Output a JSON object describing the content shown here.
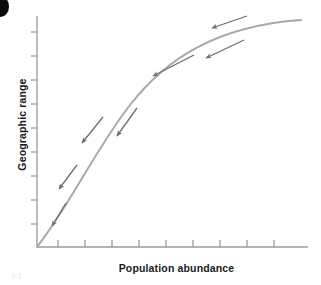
{
  "figure": {
    "caption": "(c)",
    "corner_mark": "page-edge-blob",
    "axes": {
      "x": {
        "label": "Population abundance",
        "tick_count": 9,
        "tick_positions": [
          58,
          85,
          112,
          139,
          166,
          193,
          220,
          247,
          274
        ],
        "axis_color": "#9a9a9a",
        "origin_x": 37,
        "end_x": 308,
        "y": 247
      },
      "y": {
        "label": "Geographic range",
        "tick_count": 9,
        "tick_positions": [
          32,
          56,
          80,
          104,
          128,
          152,
          176,
          200,
          224
        ],
        "axis_color": "#9a9a9a",
        "origin_y": 247,
        "end_y": 16,
        "x": 37
      }
    },
    "curve": {
      "name": "saturating-growth-curve",
      "color": "#a8a8a8",
      "stroke_width": 2.0,
      "path": "M 37,247 C 70,205 95,150 130,105 C 165,60 215,26 301,20"
    },
    "arrows": {
      "color": "#6e6e6e",
      "direction_note": "all arrows point down-left along the curve toward the origin",
      "count": 7,
      "items": [
        {
          "name": "arrow-1",
          "x1": 247,
          "y1": 16,
          "x2": 212,
          "y2": 28
        },
        {
          "name": "arrow-2",
          "x1": 244,
          "y1": 40,
          "x2": 206,
          "y2": 58
        },
        {
          "name": "arrow-3",
          "x1": 194,
          "y1": 55,
          "x2": 153,
          "y2": 76
        },
        {
          "name": "arrow-4",
          "x1": 137,
          "y1": 108,
          "x2": 117,
          "y2": 136
        },
        {
          "name": "arrow-5",
          "x1": 103,
          "y1": 117,
          "x2": 82,
          "y2": 143
        },
        {
          "name": "arrow-6",
          "x1": 77,
          "y1": 165,
          "x2": 59,
          "y2": 189
        },
        {
          "name": "arrow-7",
          "x1": 66,
          "y1": 203,
          "x2": 52,
          "y2": 226
        }
      ]
    }
  },
  "chart_data": {
    "type": "line",
    "title": "",
    "xlabel": "Population abundance",
    "ylabel": "Geographic range",
    "grid": false,
    "legend": "none",
    "axis_ticks_unlabeled": true,
    "xlim": [
      0,
      10
    ],
    "ylim": [
      0,
      10
    ],
    "series": [
      {
        "name": "Geographic range vs population abundance",
        "x": [
          0,
          0.5,
          1,
          1.5,
          2,
          2.5,
          3,
          3.5,
          4,
          4.5,
          5,
          5.5,
          6,
          6.5,
          7,
          7.5,
          8,
          8.5,
          9,
          9.5,
          10
        ],
        "y": [
          0,
          0.95,
          1.85,
          2.7,
          3.5,
          4.25,
          4.95,
          5.6,
          6.2,
          6.75,
          7.25,
          7.7,
          8.1,
          8.45,
          8.75,
          9.0,
          9.2,
          9.35,
          9.45,
          9.5,
          9.52
        ]
      }
    ],
    "annotations": [
      {
        "type": "arrow",
        "label": "decline direction",
        "from": [
          8.0,
          9.4
        ],
        "to": [
          6.6,
          9.0
        ]
      },
      {
        "type": "arrow",
        "label": "decline direction",
        "from": [
          7.9,
          8.4
        ],
        "to": [
          6.4,
          7.7
        ]
      },
      {
        "type": "arrow",
        "label": "decline direction",
        "from": [
          6.0,
          7.8
        ],
        "to": [
          4.4,
          7.0
        ]
      },
      {
        "type": "arrow",
        "label": "decline direction",
        "from": [
          3.8,
          5.6
        ],
        "to": [
          3.1,
          4.4
        ]
      },
      {
        "type": "arrow",
        "label": "decline direction",
        "from": [
          2.6,
          5.2
        ],
        "to": [
          1.8,
          4.1
        ]
      },
      {
        "type": "arrow",
        "label": "decline direction",
        "from": [
          1.6,
          3.0
        ],
        "to": [
          0.9,
          2.0
        ]
      },
      {
        "type": "arrow",
        "label": "decline direction",
        "from": [
          1.1,
          1.4
        ],
        "to": [
          0.6,
          0.4
        ]
      }
    ]
  }
}
